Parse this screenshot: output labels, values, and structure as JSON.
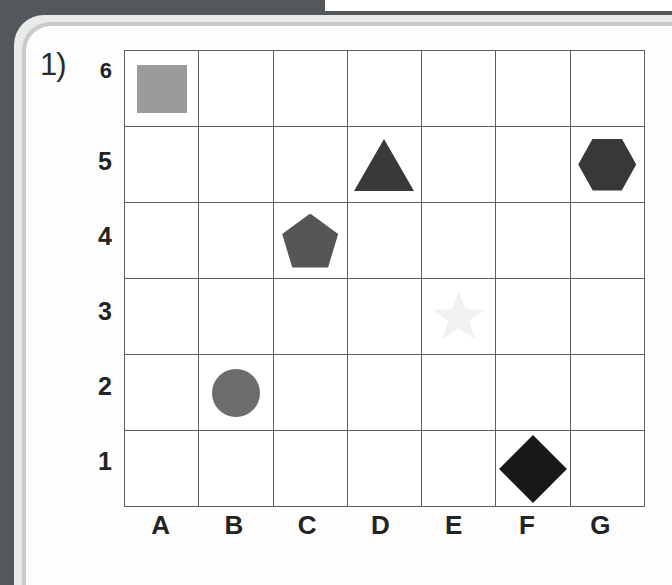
{
  "worksheet": {
    "question_number": "1)",
    "grid": {
      "column_labels": [
        "A",
        "B",
        "C",
        "D",
        "E",
        "F",
        "G"
      ],
      "row_labels": [
        "6",
        "5",
        "4",
        "3",
        "2",
        "1"
      ],
      "columns": 7,
      "rows": 6
    }
  },
  "shapes": [
    {
      "name": "square",
      "cell": "A6",
      "col": 0,
      "row": 0,
      "color": "#9b9b9b"
    },
    {
      "name": "triangle",
      "cell": "D5",
      "col": 3,
      "row": 1,
      "color": "#3a3a3c"
    },
    {
      "name": "hexagon",
      "cell": "G5",
      "col": 6,
      "row": 1,
      "color": "#38383a"
    },
    {
      "name": "pentagon",
      "cell": "C4",
      "col": 2,
      "row": 2,
      "color": "#565658"
    },
    {
      "name": "star",
      "cell": "E3",
      "col": 4,
      "row": 3,
      "color": "#f1f1f1"
    },
    {
      "name": "circle",
      "cell": "B2",
      "col": 1,
      "row": 4,
      "color": "#6c6c6e"
    },
    {
      "name": "rectangle",
      "cell": "D1",
      "col": 3,
      "row": 5,
      "color": "#38383a"
    },
    {
      "name": "diamond",
      "cell": "F1",
      "col": 5,
      "row": 5,
      "color": "#18181a"
    }
  ],
  "colors": {
    "backdrop": "#55585a",
    "card_outer": "#e9eaea",
    "card_mid": "#c9cbcc",
    "card_inner": "#fdfdfd",
    "grid_line": "#5c5f61",
    "label_text": "#232323"
  }
}
